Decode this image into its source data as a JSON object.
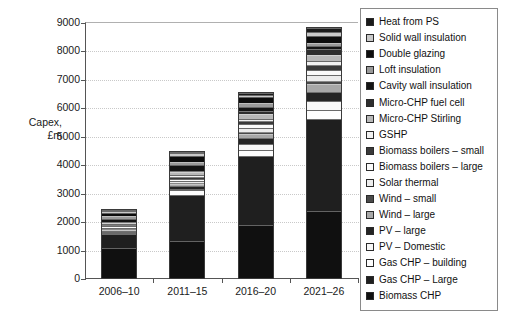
{
  "axis": {
    "title": "Capex,\n£m",
    "y_ticks": [
      9000,
      8000,
      7000,
      6000,
      5000,
      4000,
      3000,
      2000,
      1000,
      0
    ],
    "x_categories": [
      "2006–10",
      "2011–15",
      "2016–20",
      "2021–26"
    ]
  },
  "legend": {
    "items": [
      {
        "label": "Heat from PS",
        "color": "#1a1a1a"
      },
      {
        "label": "Solid wall insulation",
        "color": "#c9c9c9"
      },
      {
        "label": "Double glazing",
        "color": "#0d0d0d"
      },
      {
        "label": "Loft insulation",
        "color": "#9a9a9a"
      },
      {
        "label": "Cavity wall insulation",
        "color": "#141414"
      },
      {
        "label": "Micro-CHP fuel cell",
        "color": "#2e2e2e"
      },
      {
        "label": "Micro-CHP Stirling",
        "color": "#b8b8b8"
      },
      {
        "label": "GSHP",
        "color": "#f2f2f2"
      },
      {
        "label": "Biomass boilers – small",
        "color": "#3a3a3a"
      },
      {
        "label": "Biomass boilers – large",
        "color": "#fbfbfb"
      },
      {
        "label": "Solar thermal",
        "color": "#ededed"
      },
      {
        "label": "Wind – small",
        "color": "#4a4a4a"
      },
      {
        "label": "Wind – large",
        "color": "#a8a8a8"
      },
      {
        "label": "PV – large",
        "color": "#242424"
      },
      {
        "label": "PV – Domestic",
        "color": "#f7f7f7"
      },
      {
        "label": "Gas CHP – building",
        "color": "#fdfdfd"
      },
      {
        "label": "Gas CHP – Large",
        "color": "#1f1f1f"
      },
      {
        "label": "Biomass CHP",
        "color": "#101010"
      }
    ]
  },
  "chart_data": {
    "type": "bar",
    "subtype": "stacked",
    "title": "",
    "xlabel": "",
    "ylabel": "Capex, £m",
    "ylim": [
      0,
      9000
    ],
    "ytick_step": 1000,
    "grid": true,
    "legend_position": "right",
    "categories": [
      "2006–10",
      "2011–15",
      "2016–20",
      "2021–26"
    ],
    "totals": [
      2320,
      4450,
      6480,
      8480
    ],
    "series": [
      {
        "name": "Biomass CHP",
        "color": "#101010",
        "values": [
          1060,
          1310,
          1860,
          2350
        ]
      },
      {
        "name": "Gas CHP – Large",
        "color": "#1f1f1f",
        "values": [
          480,
          1600,
          2420,
          3230
        ]
      },
      {
        "name": "Gas CHP – building",
        "color": "#fdfdfd",
        "values": [
          30,
          170,
          230,
          330
        ]
      },
      {
        "name": "PV – Domestic",
        "color": "#f7f7f7",
        "values": [
          20,
          60,
          190,
          330
        ]
      },
      {
        "name": "PV – large",
        "color": "#242424",
        "values": [
          30,
          90,
          210,
          300
        ]
      },
      {
        "name": "Wind – large",
        "color": "#a8a8a8",
        "values": [
          60,
          90,
          160,
          290
        ]
      },
      {
        "name": "Wind – small",
        "color": "#4a4a4a",
        "values": [
          30,
          40,
          70,
          110
        ]
      },
      {
        "name": "Solar thermal",
        "color": "#ededed",
        "values": [
          30,
          60,
          130,
          200
        ]
      },
      {
        "name": "Biomass boilers – large",
        "color": "#fbfbfb",
        "values": [
          40,
          80,
          130,
          180
        ]
      },
      {
        "name": "Biomass boilers – small",
        "color": "#3a3a3a",
        "values": [
          40,
          70,
          110,
          160
        ]
      },
      {
        "name": "GSHP",
        "color": "#f2f2f2",
        "values": [
          30,
          60,
          100,
          150
        ]
      },
      {
        "name": "Micro-CHP Stirling",
        "color": "#b8b8b8",
        "values": [
          40,
          90,
          150,
          220
        ]
      },
      {
        "name": "Micro-CHP fuel cell",
        "color": "#2e2e2e",
        "values": [
          30,
          60,
          120,
          200
        ]
      },
      {
        "name": "Cavity wall insulation",
        "color": "#141414",
        "values": [
          120,
          190,
          150,
          110
        ]
      },
      {
        "name": "Loft insulation",
        "color": "#9a9a9a",
        "values": [
          90,
          120,
          110,
          90
        ]
      },
      {
        "name": "Double glazing",
        "color": "#0d0d0d",
        "values": [
          130,
          200,
          230,
          260
        ]
      },
      {
        "name": "Solid wall insulation",
        "color": "#c9c9c9",
        "values": [
          40,
          110,
          80,
          130
        ]
      },
      {
        "name": "Heat from PS",
        "color": "#1a1a1a",
        "values": [
          20,
          50,
          60,
          140
        ]
      }
    ]
  }
}
